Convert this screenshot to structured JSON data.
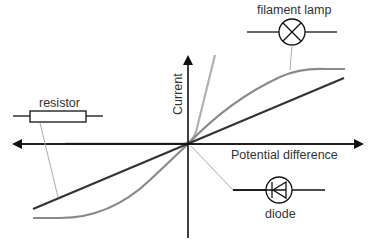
{
  "diagram": {
    "axes": {
      "x_label": "Potential difference",
      "y_label": "Current"
    },
    "components": [
      {
        "name": "resistor",
        "label": "resistor",
        "curve": "straight line through origin"
      },
      {
        "name": "filament-lamp",
        "label": "filament lamp",
        "curve": "S-shaped curve levelling off"
      },
      {
        "name": "diode",
        "label": "diode",
        "curve": "zero in reverse, steep rise in forward"
      }
    ],
    "colors": {
      "axis": "#111111",
      "resistor_line": "#333333",
      "lamp_curve": "#888888",
      "diode_curve": "#aaaaaa",
      "leader_line": "#aaaaaa"
    }
  }
}
